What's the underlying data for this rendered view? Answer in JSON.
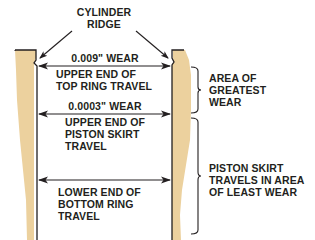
{
  "diagram": {
    "colors": {
      "wall_fill": "#ecd19e",
      "line": "#231f20",
      "background": "#ffffff"
    },
    "labels": {
      "cylinder_ridge": "CYLINDER\nRIDGE",
      "top_wear": "0.009\" WEAR",
      "upper_end_top_ring": "UPPER END OF\nTOP RING TRAVEL",
      "mid_wear": "0.0003\" WEAR",
      "upper_end_piston_skirt": "UPPER END OF\nPISTON SKIRT\nTRAVEL",
      "lower_end_bottom_ring": "LOWER END OF\nBOTTOM RING\nTRAVEL",
      "area_greatest_wear": "AREA OF\nGREATEST\nWEAR",
      "piston_skirt_least_wear": "PISTON SKIRT\nTRAVELS IN AREA\nOF LEAST WEAR"
    },
    "icons": {
      "arrows": [
        "double-arrow-top",
        "double-arrow-middle",
        "double-arrow-bottom",
        "ridge-pointer-left",
        "ridge-pointer-right"
      ],
      "brackets": [
        "brace-greatest-wear",
        "brace-least-wear"
      ]
    }
  }
}
